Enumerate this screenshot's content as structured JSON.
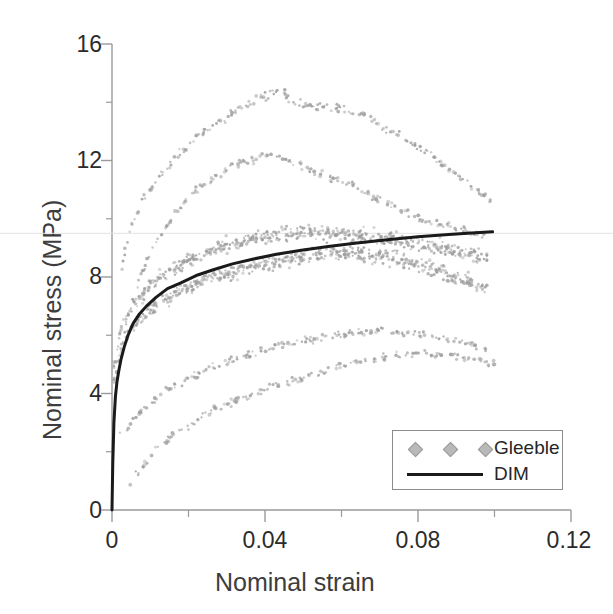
{
  "chart_data": {
    "type": "scatter",
    "title": "",
    "xlabel": "Nominal strain",
    "ylabel": "Nominal stress (MPa)",
    "xlim": [
      0,
      0.12
    ],
    "ylim": [
      0,
      16
    ],
    "xticks": [
      "0",
      "0.04",
      "0.08",
      "0.12"
    ],
    "xtick_values": [
      0,
      0.04,
      0.08,
      0.12
    ],
    "xminor_ticks": [
      0.02,
      0.06,
      0.1
    ],
    "yticks": [
      "0",
      "4",
      "8",
      "12",
      "16"
    ],
    "ytick_values": [
      0,
      4,
      8,
      12,
      16
    ],
    "yminor_ticks": [
      2,
      6,
      10,
      14
    ],
    "grid": false,
    "legend_position": "lower-right",
    "legend": [
      {
        "label": "Gleeble",
        "marker": "diamond",
        "color": "#b9b9b9"
      },
      {
        "label": "DIM",
        "marker": "line",
        "color": "#1a1a1a"
      }
    ],
    "series": [
      {
        "name": "Gleeble",
        "type": "scatter",
        "color": "#9e9e9e",
        "marker": "dot",
        "curves": [
          {
            "name": "specimen-1",
            "peak_stress": 14.5,
            "peak_strain": 0.045,
            "x": [
              0.0015,
              0.003,
              0.0045,
              0.006,
              0.008,
              0.01,
              0.012,
              0.014,
              0.016,
              0.018,
              0.02,
              0.022,
              0.024,
              0.026,
              0.028,
              0.03,
              0.032,
              0.034,
              0.036,
              0.038,
              0.04,
              0.042,
              0.044,
              0.046,
              0.048,
              0.05,
              0.052,
              0.054,
              0.056,
              0.058,
              0.06,
              0.063,
              0.066,
              0.069,
              0.072,
              0.075,
              0.078,
              0.081,
              0.084,
              0.087,
              0.09,
              0.093,
              0.096,
              0.099
            ],
            "y": [
              7.4,
              8.6,
              9.5,
              10.1,
              10.6,
              11.0,
              11.4,
              11.7,
              12.0,
              12.3,
              12.6,
              12.8,
              13.0,
              13.2,
              13.4,
              13.5,
              13.7,
              13.8,
              13.9,
              14.1,
              14.2,
              14.3,
              14.5,
              14.2,
              14.0,
              13.9,
              13.9,
              13.8,
              13.9,
              13.8,
              13.8,
              13.7,
              13.6,
              13.3,
              13.1,
              12.9,
              12.6,
              12.4,
              12.1,
              11.8,
              11.5,
              11.2,
              10.9,
              10.6
            ]
          },
          {
            "name": "specimen-2",
            "peak_stress": 12.2,
            "peak_strain": 0.042,
            "x": [
              0.002,
              0.004,
              0.006,
              0.008,
              0.01,
              0.012,
              0.014,
              0.016,
              0.018,
              0.02,
              0.022,
              0.024,
              0.026,
              0.028,
              0.03,
              0.032,
              0.034,
              0.036,
              0.038,
              0.04,
              0.042,
              0.044,
              0.046,
              0.048,
              0.05,
              0.053,
              0.056,
              0.059,
              0.062,
              0.065,
              0.068,
              0.071,
              0.074,
              0.077,
              0.08,
              0.083,
              0.086,
              0.089,
              0.092,
              0.095,
              0.098
            ],
            "y": [
              5.2,
              6.6,
              7.5,
              8.2,
              8.8,
              9.3,
              9.7,
              10.1,
              10.4,
              10.7,
              11.0,
              11.2,
              11.4,
              11.5,
              11.7,
              11.8,
              11.9,
              12.0,
              12.1,
              12.1,
              12.2,
              12.1,
              12.0,
              11.9,
              11.8,
              11.6,
              11.5,
              11.3,
              11.2,
              11.0,
              10.8,
              10.6,
              10.4,
              10.2,
              10.0,
              9.9,
              9.8,
              9.7,
              9.6,
              9.5,
              9.4
            ]
          },
          {
            "name": "specimen-3",
            "peak_stress": 9.6,
            "peak_strain": 0.05,
            "x": [
              0.001,
              0.002,
              0.003,
              0.004,
              0.006,
              0.008,
              0.01,
              0.013,
              0.016,
              0.019,
              0.022,
              0.025,
              0.028,
              0.031,
              0.034,
              0.037,
              0.04,
              0.043,
              0.046,
              0.05,
              0.054,
              0.058,
              0.062,
              0.066,
              0.07,
              0.074,
              0.078,
              0.082,
              0.086,
              0.09,
              0.094,
              0.098
            ],
            "y": [
              5.0,
              6.0,
              6.4,
              6.7,
              7.1,
              7.4,
              7.7,
              8.0,
              8.3,
              8.5,
              8.7,
              8.9,
              9.0,
              9.1,
              9.2,
              9.3,
              9.4,
              9.5,
              9.5,
              9.6,
              9.5,
              9.5,
              9.4,
              9.4,
              9.3,
              9.3,
              9.2,
              9.1,
              9.0,
              8.9,
              8.8,
              8.7
            ]
          },
          {
            "name": "specimen-4",
            "peak_stress": 8.9,
            "peak_strain": 0.06,
            "x": [
              0.001,
              0.002,
              0.003,
              0.005,
              0.007,
              0.009,
              0.012,
              0.015,
              0.018,
              0.021,
              0.024,
              0.027,
              0.03,
              0.034,
              0.038,
              0.042,
              0.046,
              0.05,
              0.054,
              0.058,
              0.062,
              0.066,
              0.07,
              0.074,
              0.078,
              0.082,
              0.086,
              0.09,
              0.094,
              0.098
            ],
            "y": [
              4.4,
              5.3,
              5.8,
              6.2,
              6.5,
              6.8,
              7.1,
              7.3,
              7.5,
              7.7,
              7.9,
              8.0,
              8.1,
              8.3,
              8.4,
              8.5,
              8.6,
              8.7,
              8.8,
              8.9,
              8.8,
              8.8,
              8.7,
              8.6,
              8.5,
              8.4,
              8.2,
              8.0,
              7.8,
              7.6
            ]
          },
          {
            "name": "specimen-5",
            "peak_stress": 6.2,
            "peak_strain": 0.07,
            "x": [
              0.003,
              0.006,
              0.009,
              0.012,
              0.015,
              0.018,
              0.021,
              0.024,
              0.027,
              0.03,
              0.034,
              0.038,
              0.042,
              0.046,
              0.05,
              0.054,
              0.058,
              0.062,
              0.066,
              0.07,
              0.074,
              0.078,
              0.082,
              0.086,
              0.09,
              0.094,
              0.098
            ],
            "y": [
              2.6,
              3.2,
              3.6,
              3.9,
              4.2,
              4.4,
              4.6,
              4.8,
              4.9,
              5.1,
              5.3,
              5.4,
              5.6,
              5.7,
              5.8,
              5.9,
              6.0,
              6.1,
              6.1,
              6.2,
              6.1,
              6.1,
              6.0,
              5.9,
              5.8,
              5.7,
              5.6
            ]
          },
          {
            "name": "specimen-6",
            "peak_stress": 5.4,
            "peak_strain": 0.08,
            "x": [
              0.005,
              0.009,
              0.013,
              0.017,
              0.021,
              0.025,
              0.029,
              0.033,
              0.037,
              0.041,
              0.045,
              0.049,
              0.053,
              0.057,
              0.061,
              0.065,
              0.069,
              0.073,
              0.077,
              0.081,
              0.085,
              0.089,
              0.093,
              0.097,
              0.1
            ],
            "y": [
              0.9,
              1.7,
              2.2,
              2.7,
              3.0,
              3.3,
              3.6,
              3.8,
              4.0,
              4.2,
              4.4,
              4.5,
              4.7,
              4.8,
              5.0,
              5.1,
              5.2,
              5.3,
              5.3,
              5.4,
              5.3,
              5.3,
              5.2,
              5.1,
              5.0
            ]
          }
        ]
      },
      {
        "name": "DIM",
        "type": "line",
        "color": "#1a1a1a",
        "x": [
          0,
          0.0002,
          0.0005,
          0.0009,
          0.0013,
          0.0018,
          0.0024,
          0.0032,
          0.0042,
          0.0055,
          0.007,
          0.009,
          0.0115,
          0.0145,
          0.018,
          0.022,
          0.0265,
          0.0315,
          0.037,
          0.043,
          0.0495,
          0.0565,
          0.064,
          0.072,
          0.08,
          0.088,
          0.094,
          0.0995
        ],
        "y": [
          0.0,
          1.6,
          3.0,
          3.9,
          4.4,
          4.8,
          5.2,
          5.6,
          6.0,
          6.4,
          6.7,
          7.0,
          7.3,
          7.6,
          7.8,
          8.05,
          8.25,
          8.45,
          8.62,
          8.78,
          8.92,
          9.05,
          9.17,
          9.28,
          9.38,
          9.46,
          9.51,
          9.55
        ]
      }
    ]
  },
  "axes": {
    "ylabel": "Nominal stress (MPa)",
    "xlabel": "Nominal strain",
    "ytick_labels": [
      "16",
      "12",
      "8",
      "4",
      "0"
    ],
    "xtick_labels": [
      "0",
      "0.04",
      "0.08",
      "0.12"
    ]
  },
  "legend": {
    "gleeble_label": "Gleeble",
    "dim_label": "DIM"
  },
  "colors": {
    "scatter": "#9e9e9e",
    "line": "#1a1a1a",
    "axis": "#9a9a9a",
    "text": "#2b2b2b"
  }
}
